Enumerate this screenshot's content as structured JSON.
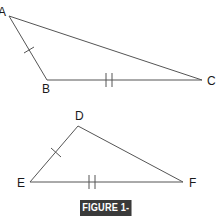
{
  "figure": {
    "caption": "FIGURE 1-18",
    "caption_bg": "#3a3a3a",
    "caption_fg": "#ffffff",
    "line_color": "#555555"
  },
  "triangles": [
    {
      "name": "ABC",
      "vertices": [
        {
          "label": "A",
          "x": 9,
          "y": 16
        },
        {
          "label": "B",
          "x": 47,
          "y": 80
        },
        {
          "label": "C",
          "x": 202,
          "y": 80
        }
      ],
      "marks": [
        {
          "side": "AB",
          "ticks": 1
        },
        {
          "side": "BC",
          "ticks": 2
        }
      ]
    },
    {
      "name": "DEF",
      "vertices": [
        {
          "label": "D",
          "x": 78,
          "y": 126
        },
        {
          "label": "E",
          "x": 30,
          "y": 182
        },
        {
          "label": "F",
          "x": 183,
          "y": 182
        }
      ],
      "marks": [
        {
          "side": "DE",
          "ticks": 1
        },
        {
          "side": "EF",
          "ticks": 2
        }
      ]
    }
  ]
}
